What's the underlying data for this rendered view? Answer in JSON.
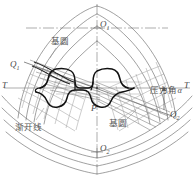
{
  "figure": {
    "title": "",
    "type": "involute-gear-meshing-diagram",
    "width": 194,
    "height": 179,
    "background": "#ffffff"
  },
  "colors": {
    "background": "#ffffff",
    "axis": "#8a8a8a",
    "thin_curve": "#6e6e6e",
    "tooth_outline": "#111111",
    "label_text": "#565656",
    "math_text": "#4a4a4a",
    "grid_mesh": "#9a9a9a"
  },
  "labels": {
    "center_top": "O",
    "center_top_sub": "1",
    "center_bottom": "O",
    "center_bottom_sub": "2",
    "q_left": "Q",
    "q_left_sub": "1",
    "q_right": "Q",
    "q_right_sub": "2",
    "tangent_left": "T",
    "tangent_right": "T",
    "pitch_point": "P",
    "base_circle_upper": "基圆",
    "base_circle_lower": "基圆",
    "involute": "渐开线",
    "pressure_angle": "压力角",
    "pressure_angle_symbol": "α"
  },
  "geometry": {
    "vertical_axis_x": 97,
    "horizontal_axis_y": 88,
    "center_o1": {
      "x": 97,
      "y": 28
    },
    "center_o2": {
      "x": 97,
      "y": 152
    },
    "pitch_point_p": {
      "x": 97,
      "y": 88
    },
    "q1": {
      "x": 28,
      "y": 72
    },
    "q2": {
      "x": 168,
      "y": 115
    },
    "line_of_action_angle_deg": 20
  },
  "annotations": [
    {
      "name": "o1-label",
      "text": "O₁",
      "x": 100,
      "y": 22
    },
    {
      "name": "o2-label",
      "text": "O₂",
      "x": 100,
      "y": 146
    },
    {
      "name": "q1-label",
      "text": "Q₁",
      "x": 12,
      "y": 62
    },
    {
      "name": "q2-label",
      "text": "Q₂",
      "x": 172,
      "y": 112
    },
    {
      "name": "t-left-label",
      "text": "T",
      "x": 2,
      "y": 81
    },
    {
      "name": "t-right-label",
      "text": "T",
      "x": 184,
      "y": 81
    },
    {
      "name": "p-label",
      "text": "P",
      "x": 92,
      "y": 106
    },
    {
      "name": "base-circle-upper-label",
      "text": "基圆",
      "x": 52,
      "y": 38
    },
    {
      "name": "base-circle-lower-label",
      "text": "基圆",
      "x": 110,
      "y": 120
    },
    {
      "name": "involute-label",
      "text": "渐开线",
      "x": 16,
      "y": 124
    },
    {
      "name": "pressure-angle-label",
      "text": "压力角α",
      "x": 152,
      "y": 88
    }
  ]
}
